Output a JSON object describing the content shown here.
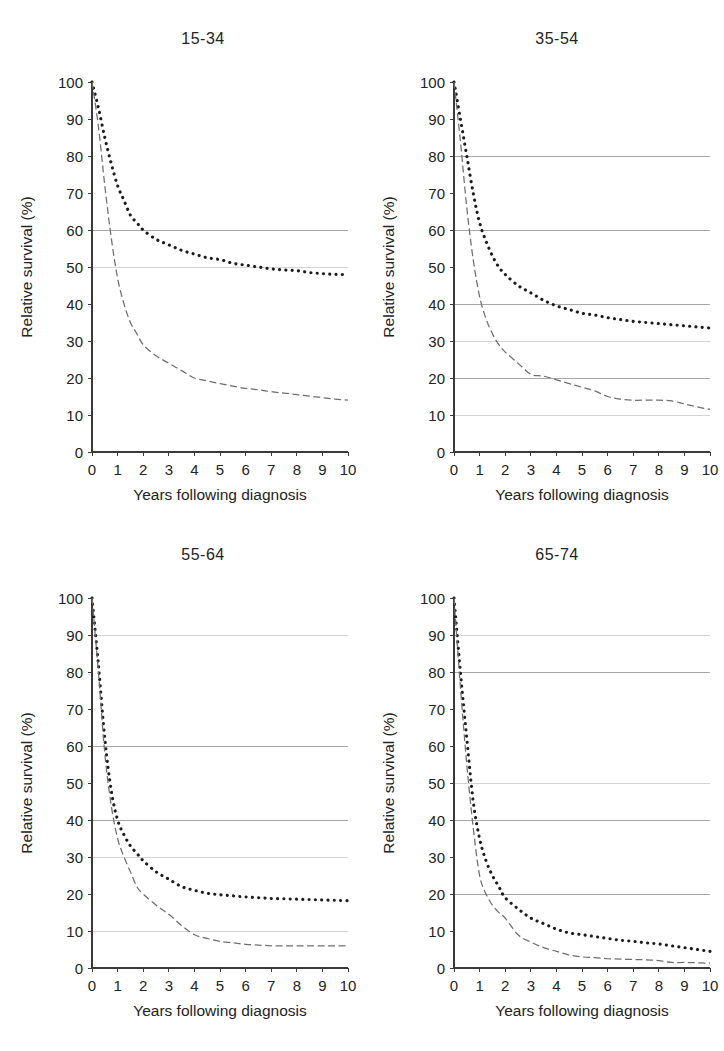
{
  "figure": {
    "background_color": "#ffffff",
    "layout": "2x2 grid of survival curve panels"
  },
  "axis": {
    "xlabel": "Years following diagnosis",
    "ylabel": "Relative survival (%)",
    "x_ticks": [
      "0",
      "1",
      "2",
      "3",
      "4",
      "5",
      "6",
      "7",
      "8",
      "9",
      "10"
    ],
    "y_ticks": [
      "0",
      "10",
      "20",
      "30",
      "40",
      "50",
      "60",
      "70",
      "80",
      "90",
      "100"
    ],
    "xlim": [
      0,
      10
    ],
    "ylim": [
      0,
      100
    ]
  },
  "series_styles": {
    "observed": {
      "name": "upper-curve",
      "color": "#1c1c1c",
      "style": "bold-dotted"
    },
    "relative": {
      "name": "lower-curve",
      "color": "#6e6e6e",
      "style": "thin-dashed"
    }
  },
  "chart_data": [
    {
      "type": "line",
      "title": "15-34",
      "xlabel": "Years following diagnosis",
      "ylabel": "Relative survival (%)",
      "xlim": [
        0,
        10
      ],
      "ylim": [
        0,
        100
      ],
      "grid": true,
      "gridlines_y": [
        50,
        60
      ],
      "legend": "none",
      "x": [
        0,
        0.25,
        0.5,
        0.75,
        1,
        1.25,
        1.5,
        1.75,
        2,
        2.5,
        3,
        3.5,
        4,
        4.5,
        5,
        5.5,
        6,
        6.5,
        7,
        7.5,
        8,
        8.5,
        9,
        9.5,
        10
      ],
      "series": [
        {
          "name": "upper-curve",
          "values": [
            100,
            93,
            85,
            78,
            72,
            68,
            64,
            62,
            60,
            57.5,
            56,
            54.5,
            53.5,
            52.5,
            52,
            51,
            50.5,
            50,
            49.5,
            49.2,
            49,
            48.5,
            48.2,
            48,
            48
          ]
        },
        {
          "name": "lower-curve",
          "values": [
            100,
            88,
            72,
            58,
            47,
            40,
            35,
            32,
            29,
            26,
            24,
            22,
            20,
            19.2,
            18.5,
            17.8,
            17.2,
            16.8,
            16.3,
            15.9,
            15.5,
            15.1,
            14.7,
            14.3,
            14
          ]
        }
      ]
    },
    {
      "type": "line",
      "title": "35-54",
      "xlabel": "Years following diagnosis",
      "ylabel": "Relative survival (%)",
      "xlim": [
        0,
        10
      ],
      "ylim": [
        0,
        100
      ],
      "grid": true,
      "gridlines_y": [
        10,
        20,
        30,
        40,
        60,
        80
      ],
      "legend": "none",
      "x": [
        0,
        0.25,
        0.5,
        0.75,
        1,
        1.25,
        1.5,
        1.75,
        2,
        2.5,
        3,
        3.5,
        4,
        4.5,
        5,
        5.5,
        6,
        6.5,
        7,
        7.5,
        8,
        8.5,
        9,
        9.5,
        10
      ],
      "series": [
        {
          "name": "upper-curve",
          "values": [
            100,
            90,
            80,
            70,
            62,
            57,
            53,
            50,
            48,
            45,
            43,
            41,
            39.5,
            38.5,
            37.5,
            37,
            36.3,
            35.8,
            35.3,
            35,
            34.7,
            34.4,
            34.1,
            33.8,
            33.5
          ]
        },
        {
          "name": "lower-curve",
          "values": [
            100,
            84,
            66,
            52,
            42,
            36,
            32,
            29,
            27,
            24,
            21,
            20.5,
            19.5,
            18.5,
            17.5,
            16.5,
            15,
            14.3,
            14,
            14,
            14,
            13.8,
            13,
            12.2,
            11.5
          ]
        }
      ]
    },
    {
      "type": "line",
      "title": "55-64",
      "xlabel": "Years following diagnosis",
      "ylabel": "Relative survival (%)",
      "xlim": [
        0,
        10
      ],
      "ylim": [
        0,
        100
      ],
      "grid": true,
      "gridlines_y": [
        10,
        30,
        40,
        60,
        90
      ],
      "legend": "none",
      "x": [
        0,
        0.25,
        0.5,
        0.75,
        1,
        1.25,
        1.5,
        1.75,
        2,
        2.5,
        3,
        3.5,
        4,
        4.5,
        5,
        5.5,
        6,
        6.5,
        7,
        7.5,
        8,
        8.5,
        9,
        9.5,
        10
      ],
      "series": [
        {
          "name": "upper-curve",
          "values": [
            100,
            82,
            62,
            48,
            40,
            36,
            33,
            31,
            29,
            26,
            24,
            22,
            21,
            20.2,
            19.8,
            19.5,
            19.2,
            19,
            18.8,
            18.7,
            18.6,
            18.5,
            18.4,
            18.3,
            18.2
          ]
        },
        {
          "name": "lower-curve",
          "values": [
            100,
            80,
            58,
            44,
            35,
            30,
            26,
            22,
            20,
            17,
            14.5,
            11.5,
            9,
            8,
            7.2,
            6.8,
            6.4,
            6.2,
            6,
            6,
            6,
            6,
            6,
            6,
            6
          ]
        }
      ]
    },
    {
      "type": "line",
      "title": "65-74",
      "xlabel": "Years following diagnosis",
      "ylabel": "Relative survival (%)",
      "xlim": [
        0,
        10
      ],
      "ylim": [
        0,
        100
      ],
      "grid": true,
      "gridlines_y": [
        20,
        40,
        50,
        80,
        90
      ],
      "legend": "none",
      "x": [
        0,
        0.25,
        0.5,
        0.75,
        1,
        1.25,
        1.5,
        1.75,
        2,
        2.5,
        3,
        3.5,
        4,
        4.5,
        5,
        5.5,
        6,
        6.5,
        7,
        7.5,
        8,
        8.5,
        9,
        9.5,
        10
      ],
      "series": [
        {
          "name": "upper-curve",
          "values": [
            100,
            80,
            62,
            45,
            35,
            29,
            25,
            22,
            19,
            16,
            13.5,
            12,
            10.5,
            9.5,
            9,
            8.5,
            8,
            7.5,
            7.2,
            6.8,
            6.5,
            6,
            5.5,
            5,
            4.5
          ]
        },
        {
          "name": "lower-curve",
          "values": [
            100,
            76,
            55,
            38,
            25,
            20,
            17,
            15,
            13.5,
            9,
            7,
            5.5,
            4.5,
            3.5,
            3,
            2.8,
            2.5,
            2.4,
            2.3,
            2.2,
            2,
            1.5,
            1.5,
            1.4,
            1.3
          ]
        }
      ]
    }
  ]
}
